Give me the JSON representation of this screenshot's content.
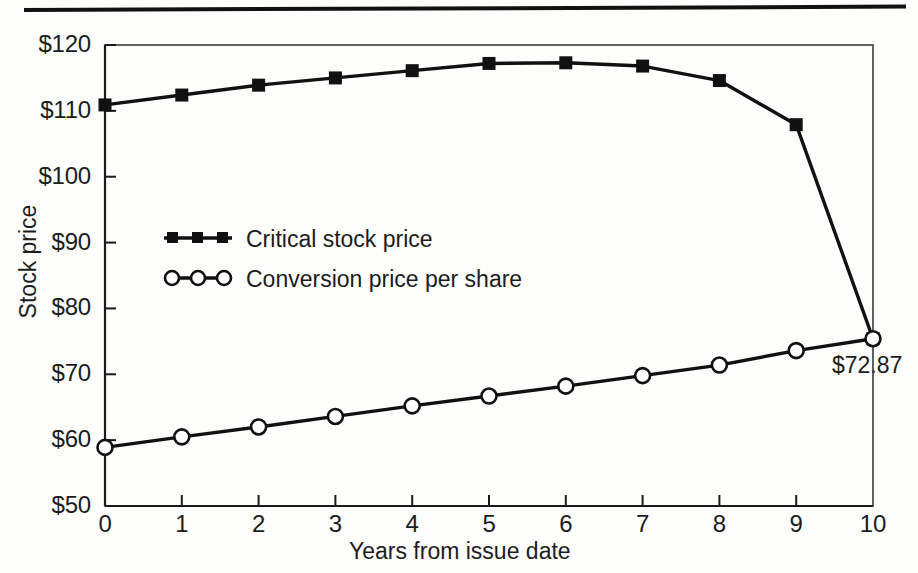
{
  "chart_data": {
    "type": "line",
    "title": "",
    "subtitle": "",
    "xlabel": "Years from issue date",
    "ylabel": "Stock price",
    "xlim": [
      0,
      10
    ],
    "ylim": [
      50,
      120
    ],
    "grid": false,
    "frame": "box",
    "legend_position": "inside-left-middle",
    "x": [
      0,
      1,
      2,
      3,
      4,
      5,
      6,
      7,
      8,
      9,
      10
    ],
    "xtick_labels": [
      "0",
      "1",
      "2",
      "3",
      "4",
      "5",
      "6",
      "7",
      "8",
      "9",
      "10"
    ],
    "ytick_values": [
      50,
      60,
      70,
      80,
      90,
      100,
      110,
      120
    ],
    "ytick_labels": [
      "$50",
      "$60",
      "$70",
      "$80",
      "$90",
      "$100",
      "$110",
      "$120"
    ],
    "series": [
      {
        "name": "Critical stock price",
        "marker": "filled-square",
        "values": [
          110.9,
          112.4,
          113.9,
          115.0,
          116.1,
          117.2,
          117.3,
          116.8,
          114.6,
          107.9,
          75.4
        ]
      },
      {
        "name": "Conversion price per share",
        "marker": "open-circle",
        "values": [
          58.9,
          60.5,
          62.0,
          63.6,
          65.2,
          66.7,
          68.2,
          69.8,
          71.4,
          73.6,
          75.4
        ]
      }
    ],
    "annotations": [
      {
        "text": "$72.87",
        "x": 10,
        "y": 72.87,
        "placement": "below-right"
      }
    ]
  },
  "legend": {
    "entries": [
      {
        "label": "Critical stock price",
        "marker": "filled-square"
      },
      {
        "label": "Conversion price per share",
        "marker": "open-circle"
      }
    ]
  },
  "colors": {
    "line": "#111111",
    "frame": "#333333",
    "text": "#1c1c1c",
    "background": "#fdfdfc"
  }
}
